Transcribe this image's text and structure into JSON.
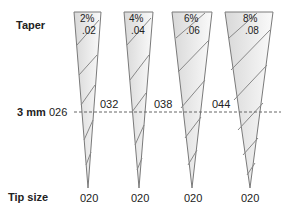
{
  "labels": {
    "taper": "Taper",
    "three_mm": "3 mm",
    "tip_size": "Tip size"
  },
  "files": [
    {
      "taper_pct": "2%",
      "taper_dec": ".02",
      "size_at_3mm": "026",
      "tip": "020"
    },
    {
      "taper_pct": "4%",
      "taper_dec": ".04",
      "size_at_3mm": "032",
      "tip": "020"
    },
    {
      "taper_pct": "6%",
      "taper_dec": ".06",
      "size_at_3mm": "038",
      "tip": "020"
    },
    {
      "taper_pct": "8%",
      "taper_dec": ".08",
      "size_at_3mm": "044",
      "tip": "020"
    }
  ],
  "colors": {
    "outline": "#808080",
    "fill": "#e6e6e6",
    "text": "#222222"
  }
}
